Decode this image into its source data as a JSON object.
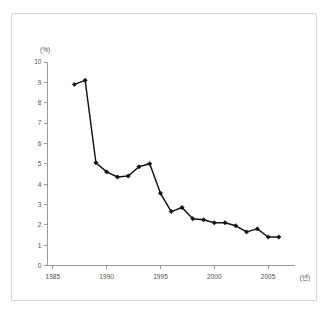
{
  "chart_data": {
    "type": "line",
    "title": "",
    "xlabel": "(년)",
    "ylabel": "(%)",
    "x": [
      1987,
      1988,
      1989,
      1990,
      1991,
      1992,
      1993,
      1994,
      1995,
      1996,
      1997,
      1998,
      1999,
      2000,
      2001,
      2002,
      2003,
      2004,
      2005,
      2006
    ],
    "values": [
      8.9,
      9.1,
      5.05,
      4.6,
      4.35,
      4.4,
      4.85,
      5.0,
      3.55,
      2.65,
      2.85,
      2.3,
      2.25,
      2.1,
      2.1,
      1.95,
      1.65,
      1.8,
      1.4,
      1.4
    ],
    "series": [
      {
        "name": "",
        "values": [
          8.9,
          9.1,
          5.05,
          4.6,
          4.35,
          4.4,
          4.85,
          5.0,
          3.55,
          2.65,
          2.85,
          2.3,
          2.25,
          2.1,
          2.1,
          1.95,
          1.65,
          1.8,
          1.4,
          1.4
        ]
      }
    ],
    "xlim": [
      1984.5,
      2007.5
    ],
    "ylim": [
      0,
      10
    ],
    "xticks": [
      1985,
      1990,
      1995,
      2000,
      2005
    ],
    "xtick_labels": [
      "1985",
      "1990",
      "1995",
      "2000",
      "2005"
    ],
    "yticks": [
      0,
      1,
      2,
      3,
      4,
      5,
      6,
      7,
      8,
      9,
      10
    ],
    "ytick_labels": [
      "0",
      "1",
      "2",
      "3",
      "4",
      "5",
      "6",
      "7",
      "8",
      "9",
      "10"
    ],
    "grid": false,
    "legend": null,
    "legend_position": "none",
    "marker": "diamond",
    "line_color": "#121212",
    "axis_color": "#9a9a9a",
    "background_color": "#ffffff",
    "frame_color": "#d8d8d8"
  },
  "axis": {
    "y_unit_label": "(%)",
    "x_unit_label": "(년)"
  }
}
